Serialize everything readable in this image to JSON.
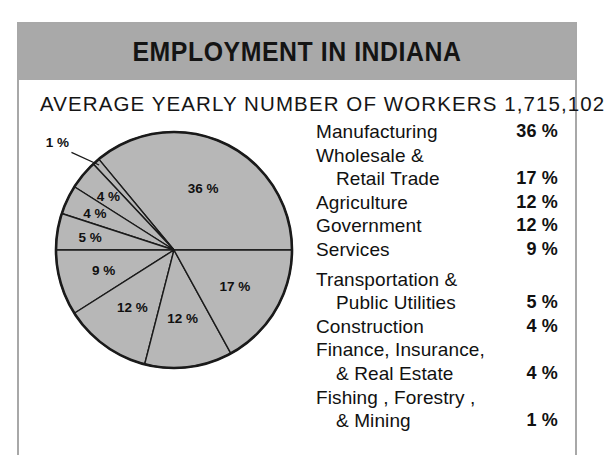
{
  "poster": {
    "title": "EMPLOYMENT IN INDIANA",
    "subtitle": "AVERAGE YEARLY NUMBER OF WORKERS 1,715,102",
    "header_color": "#a9a9a9",
    "pie_fill_color": "#b7b7b7",
    "outline_color": "#1a1a1a"
  },
  "legend": {
    "rows": [
      {
        "label": "Manufacturing",
        "pct": "36 %",
        "indent": false,
        "gap": false
      },
      {
        "label": "Wholesale &",
        "pct": "",
        "indent": false,
        "gap": false
      },
      {
        "label": "Retail Trade",
        "pct": "17 %",
        "indent": true,
        "gap": false
      },
      {
        "label": "Agriculture",
        "pct": "12 %",
        "indent": false,
        "gap": false
      },
      {
        "label": "Government",
        "pct": "12 %",
        "indent": false,
        "gap": false
      },
      {
        "label": "Services",
        "pct": "9 %",
        "indent": false,
        "gap": false
      },
      {
        "label": "Transportation &",
        "pct": "",
        "indent": false,
        "gap": true
      },
      {
        "label": "Public Utilities",
        "pct": "5 %",
        "indent": true,
        "gap": false
      },
      {
        "label": "Construction",
        "pct": "4 %",
        "indent": false,
        "gap": false
      },
      {
        "label": "Finance, Insurance,",
        "pct": "",
        "indent": false,
        "gap": false
      },
      {
        "label": "& Real Estate",
        "pct": "4 %",
        "indent": true,
        "gap": false
      },
      {
        "label": "Fishing , Forestry ,",
        "pct": "",
        "indent": false,
        "gap": false
      },
      {
        "label": "& Mining",
        "pct": "1 %",
        "indent": true,
        "gap": false
      }
    ]
  },
  "chart_data": {
    "type": "pie",
    "title": "EMPLOYMENT IN INDIANA",
    "subtitle": "AVERAGE YEARLY NUMBER OF WORKERS 1,715,102",
    "total_workers": 1715102,
    "units": "percent",
    "legend_position": "right",
    "grid": false,
    "categories": [
      "Manufacturing",
      "Wholesale & Retail Trade",
      "Agriculture",
      "Government",
      "Services",
      "Transportation & Public Utilities",
      "Construction",
      "Finance, Insurance, & Real Estate",
      "Fishing, Forestry, & Mining"
    ],
    "values": [
      36,
      17,
      12,
      12,
      9,
      5,
      4,
      4,
      1
    ],
    "slice_labels": [
      "36 %",
      "17 %",
      "12 %",
      "12 %",
      "9 %",
      "5 %",
      "4 %",
      "4 %",
      "1 %"
    ],
    "slices": [
      {
        "name": "Manufacturing",
        "value": 36,
        "label": "36 %",
        "start_deg": 0,
        "end_deg": 129.6,
        "label_outside": false
      },
      {
        "name": "Fishing, Forestry, & Mining",
        "value": 1,
        "label": "1 %",
        "start_deg": 129.6,
        "end_deg": 133.2,
        "label_outside": true
      },
      {
        "name": "Finance, Insurance, & Real Estate",
        "value": 4,
        "label": "4 %",
        "start_deg": 133.2,
        "end_deg": 147.6,
        "label_outside": false
      },
      {
        "name": "Construction",
        "value": 4,
        "label": "4 %",
        "start_deg": 147.6,
        "end_deg": 162.0,
        "label_outside": false
      },
      {
        "name": "Transportation & Public Utilities",
        "value": 5,
        "label": "5 %",
        "start_deg": 162.0,
        "end_deg": 180.0,
        "label_outside": false
      },
      {
        "name": "Services",
        "value": 9,
        "label": "9 %",
        "start_deg": 180.0,
        "end_deg": 212.4,
        "label_outside": false
      },
      {
        "name": "Agriculture",
        "value": 12,
        "label": "12 %",
        "start_deg": 212.4,
        "end_deg": 255.6,
        "label_outside": false
      },
      {
        "name": "Government",
        "value": 12,
        "label": "12 %",
        "start_deg": 255.6,
        "end_deg": 298.8,
        "label_outside": false
      },
      {
        "name": "Wholesale & Retail Trade",
        "value": 17,
        "label": "17 %",
        "start_deg": 298.8,
        "end_deg": 360.0,
        "label_outside": false
      }
    ]
  }
}
